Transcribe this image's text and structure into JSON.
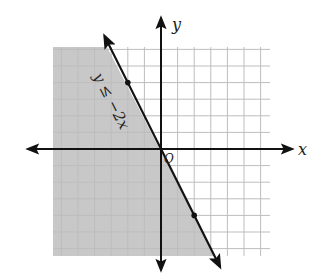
{
  "chart_data": {
    "type": "line",
    "title": "",
    "xlabel": "x",
    "ylabel": "y",
    "origin_label": "O",
    "xlim": [
      -6.5,
      6.5
    ],
    "ylim": [
      -6.5,
      6.5
    ],
    "grid": true,
    "grid_step": 1,
    "series": [
      {
        "name": "y ≤ −2x",
        "equation": "y = -2x",
        "inequality": "y <= -2x",
        "boundary": "solid",
        "shaded_side": "below-left",
        "points_marked": [
          [
            -2,
            4
          ],
          [
            2,
            -4
          ]
        ],
        "x": [
          -3.25,
          3.25
        ],
        "y": [
          6.5,
          -6.5
        ]
      }
    ],
    "annotations": [
      {
        "text": "y ≤ −2x",
        "at": [
          -2.4,
          3.2
        ],
        "rotation_deg": 63
      }
    ]
  },
  "colors": {
    "shade": "#c8c8c8",
    "grid": "#bdbdbd",
    "axis": "#111111",
    "line": "#111111"
  }
}
